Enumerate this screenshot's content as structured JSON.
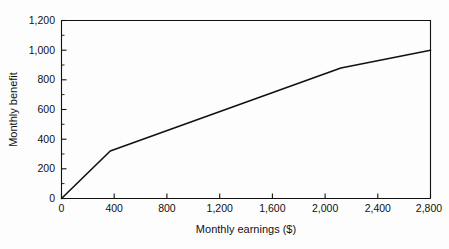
{
  "chart_data": {
    "type": "line",
    "title": "",
    "xlabel": "Monthly earnings ($)",
    "ylabel": "Monthly benefit",
    "xlim": [
      0,
      2800
    ],
    "ylim": [
      0,
      1200
    ],
    "xticks": [
      0,
      400,
      800,
      1200,
      1600,
      2000,
      2400,
      2800
    ],
    "yticks": [
      0,
      200,
      400,
      600,
      800,
      1000,
      1200
    ],
    "xtick_labels": [
      "0",
      "400",
      "800",
      "1,200",
      "1,600",
      "2,000",
      "2,400",
      "2,800"
    ],
    "ytick_labels": [
      "0",
      "200",
      "400",
      "600",
      "800",
      "1,000",
      "1,200"
    ],
    "grid": false,
    "legend": null,
    "series": [
      {
        "name": "Monthly benefit schedule",
        "color": "#111111",
        "x": [
          0,
          370,
          2120,
          2800
        ],
        "y": [
          0,
          320,
          880,
          1000
        ],
        "points": [
          {
            "x": 0,
            "y": 0
          },
          {
            "x": 370,
            "y": 320
          },
          {
            "x": 2120,
            "y": 880
          },
          {
            "x": 2800,
            "y": 1000
          }
        ]
      }
    ]
  },
  "axes": {
    "y_title": "Monthly benefit",
    "x_title": "Monthly earnings ($)",
    "y_labels": [
      "1,200",
      "1,000",
      "800",
      "600",
      "400",
      "200",
      "0"
    ],
    "x_labels": [
      "0",
      "400",
      "800",
      "1,200",
      "1,600",
      "2,000",
      "2,400",
      "2,800"
    ]
  },
  "colors": {
    "line": "#111111",
    "frame": "#111111",
    "background": "#fdfdfd",
    "text": "#111111"
  }
}
